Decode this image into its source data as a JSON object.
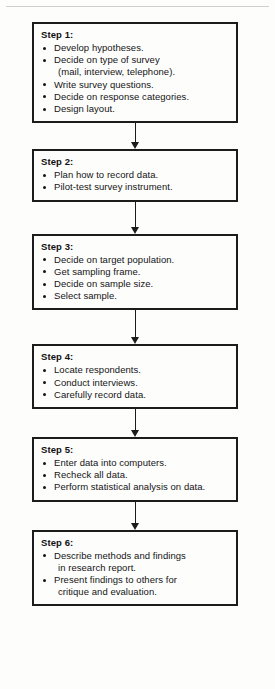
{
  "diagram": {
    "orientation": "vertical",
    "connector_icon": "down-arrow-icon",
    "border_color": "#1c1c1c",
    "text_color": "#141414",
    "background_color": "#fdfdfc",
    "steps": [
      {
        "title": "Step 1:",
        "bullets": [
          {
            "line1": "Develop hypotheses.",
            "line2": ""
          },
          {
            "line1": "Decide on type of survey",
            "line2": "(mail, interview, telephone)."
          },
          {
            "line1": "Write survey questions.",
            "line2": ""
          },
          {
            "line1": "Decide on response categories.",
            "line2": ""
          },
          {
            "line1": "Design layout.",
            "line2": ""
          }
        ]
      },
      {
        "title": "Step 2:",
        "bullets": [
          {
            "line1": "Plan how to record data.",
            "line2": ""
          },
          {
            "line1": "Pilot-test survey instrument.",
            "line2": ""
          }
        ]
      },
      {
        "title": "Step 3:",
        "bullets": [
          {
            "line1": "Decide on target population.",
            "line2": ""
          },
          {
            "line1": "Get sampling frame.",
            "line2": ""
          },
          {
            "line1": "Decide on sample size.",
            "line2": ""
          },
          {
            "line1": "Select sample.",
            "line2": ""
          }
        ]
      },
      {
        "title": "Step 4:",
        "bullets": [
          {
            "line1": "Locate respondents.",
            "line2": ""
          },
          {
            "line1": "Conduct interviews.",
            "line2": ""
          },
          {
            "line1": "Carefully record data.",
            "line2": ""
          }
        ]
      },
      {
        "title": "Step 5:",
        "bullets": [
          {
            "line1": "Enter data into computers.",
            "line2": ""
          },
          {
            "line1": "Recheck all data.",
            "line2": ""
          },
          {
            "line1": "Perform statistical analysis on data.",
            "line2": ""
          }
        ]
      },
      {
        "title": "Step 6:",
        "bullets": [
          {
            "line1": "Describe methods and findings",
            "line2": "in research report."
          },
          {
            "line1": "Present findings to others for",
            "line2": "critique and evaluation."
          }
        ]
      }
    ],
    "connector_heights": [
      26,
      32,
      34,
      28,
      28
    ]
  }
}
